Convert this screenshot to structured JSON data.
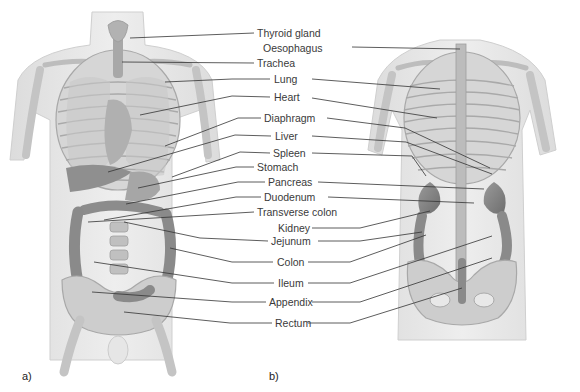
{
  "figure": {
    "panels": [
      {
        "id": "a",
        "label": "a)",
        "view": "anterior"
      },
      {
        "id": "b",
        "label": "b)",
        "view": "posterior"
      }
    ],
    "labels": [
      {
        "text": "Thyroid gland",
        "x": 257,
        "y": 26
      },
      {
        "text": "Oesophagus",
        "x": 263,
        "y": 41
      },
      {
        "text": "Trachea",
        "x": 257,
        "y": 56
      },
      {
        "text": "Lung",
        "x": 273,
        "y": 72
      },
      {
        "text": "Heart",
        "x": 273,
        "y": 91
      },
      {
        "text": "Diaphragm",
        "x": 264,
        "y": 112
      },
      {
        "text": "Liver",
        "x": 274,
        "y": 130
      },
      {
        "text": "Spleen",
        "x": 273,
        "y": 147
      },
      {
        "text": "Stomach",
        "x": 257,
        "y": 161
      },
      {
        "text": "Pancreas",
        "x": 268,
        "y": 176
      },
      {
        "text": "Duodenum",
        "x": 264,
        "y": 191
      },
      {
        "text": "Transverse colon",
        "x": 257,
        "y": 206
      },
      {
        "text": "Kidney",
        "x": 277,
        "y": 222
      },
      {
        "text": "Jejunum",
        "x": 271,
        "y": 235
      },
      {
        "text": "Colon",
        "x": 276,
        "y": 256
      },
      {
        "text": "Ileum",
        "x": 277,
        "y": 277
      },
      {
        "text": "Appendix",
        "x": 269,
        "y": 296
      },
      {
        "text": "Rectum",
        "x": 275,
        "y": 317
      }
    ],
    "colors": {
      "skin": "#e4e4e4",
      "bone": "#cfcfcf",
      "organ": "#8a8a8a",
      "leader_line": "#333333",
      "text": "#3a3a3a"
    }
  }
}
